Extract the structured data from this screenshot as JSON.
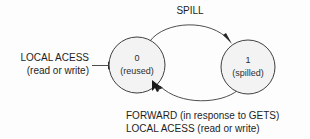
{
  "diagram": {
    "background_color": "#fdfdfd",
    "node_fill_color": "#f3f3f3",
    "stroke_color": "#3f3f3f",
    "text_color": "#1d1d1d"
  },
  "states": [
    {
      "id": "0",
      "label": "0",
      "sublabel": "(reused)",
      "cx": 137,
      "cy": 65,
      "r": 28
    },
    {
      "id": "1",
      "label": "1",
      "sublabel": "(spilled)",
      "cx": 248,
      "cy": 67,
      "r": 27
    }
  ],
  "labels": {
    "entry_line1": "LOCAL ACESS",
    "entry_line2": "(read or write)",
    "spill": "SPILL",
    "return_line1": "FORWARD (in response to GETS)",
    "return_line2": "LOCAL ACESS (read or write)"
  },
  "transitions": [
    {
      "name": "entry",
      "from": "",
      "to": "0",
      "label": "LOCAL ACESS (read or write)"
    },
    {
      "name": "spill",
      "from": "0",
      "to": "1",
      "label": "SPILL"
    },
    {
      "name": "return",
      "from": "1",
      "to": "0",
      "label": "FORWARD (in response to GETS) / LOCAL ACESS (read or write)"
    }
  ]
}
